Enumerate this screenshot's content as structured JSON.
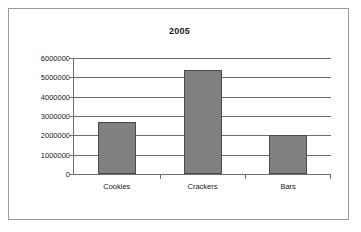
{
  "chart_data": {
    "type": "bar",
    "title": "2005",
    "xlabel": "",
    "ylabel": "",
    "categories": [
      "Cookies",
      "Crackers",
      "Bars"
    ],
    "values": [
      2700000,
      5400000,
      2000000
    ],
    "ylim": [
      0,
      6000000
    ],
    "ytick_labels": [
      "6000000",
      "5000000",
      "4000000",
      "3000000",
      "2000000",
      "1000000",
      "0"
    ],
    "ytick_values": [
      6000000,
      5000000,
      4000000,
      3000000,
      2000000,
      1000000,
      0
    ],
    "grid": true,
    "legend": false,
    "colors": {
      "bar_fill": "#808080",
      "bar_border": "#4a4a4a",
      "gridline": "#6e6e6e",
      "frame": "#9a9a9a",
      "background": "#ffffff",
      "text": "#161616"
    }
  }
}
